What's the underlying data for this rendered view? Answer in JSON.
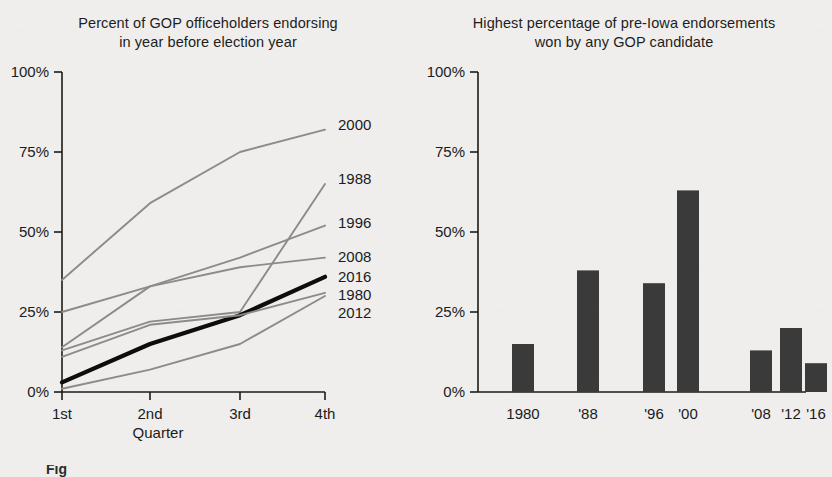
{
  "figure": {
    "caption_fragment": "Fig"
  },
  "left_chart": {
    "title_line1": "Percent of GOP officeholders endorsing",
    "title_line2": "in year before election year",
    "xlabel": "Quarter",
    "ylabel": "",
    "ytick_labels": [
      "0%",
      "25%",
      "50%",
      "75%",
      "100%"
    ],
    "xtick_labels": [
      "1st",
      "2nd",
      "3rd",
      "4th"
    ],
    "series_labels": [
      "2000",
      "1988",
      "1996",
      "2008",
      "2016",
      "1980",
      "2012"
    ]
  },
  "right_chart": {
    "title_line1": "Highest percentage of pre-Iowa endorsements",
    "title_line2": "won by any GOP candidate",
    "ytick_labels": [
      "0%",
      "25%",
      "50%",
      "75%",
      "100%"
    ],
    "xtick_labels": [
      "1980",
      "'88",
      "'96",
      "'00",
      "'08",
      "'12",
      "'16"
    ]
  },
  "colors": {
    "background": "#efeeec",
    "axis": "#1b1b1b",
    "line_gray": "#8b8b8b",
    "line_highlight": "#0d0d0d",
    "bar_fill": "#3a3a3a",
    "text": "#1b1b1b"
  },
  "chart_data": [
    {
      "type": "line",
      "title": "Percent of GOP officeholders endorsing in year before election year",
      "xlabel": "Quarter",
      "ylabel": "Percent of GOP officeholders endorsing",
      "x": [
        "1st",
        "2nd",
        "3rd",
        "4th"
      ],
      "ylim": [
        0,
        100
      ],
      "xlim_categories": 4,
      "grid": false,
      "legend": "right-of-plot end-labels",
      "series": [
        {
          "name": "2000",
          "values": [
            35,
            59,
            75,
            82
          ],
          "style": "gray",
          "end_label": "2000"
        },
        {
          "name": "1988",
          "values": [
            13,
            22,
            25,
            65
          ],
          "style": "gray",
          "end_label": "1988"
        },
        {
          "name": "1996",
          "values": [
            14,
            33,
            42,
            52
          ],
          "style": "gray",
          "end_label": "1996"
        },
        {
          "name": "2008",
          "values": [
            25,
            33,
            39,
            42
          ],
          "style": "gray",
          "end_label": "2008"
        },
        {
          "name": "2016",
          "values": [
            3,
            15,
            24,
            36
          ],
          "style": "highlight",
          "end_label": "2016"
        },
        {
          "name": "1980",
          "values": [
            11,
            21,
            24,
            31
          ],
          "style": "gray",
          "end_label": "1980"
        },
        {
          "name": "2012",
          "values": [
            1,
            7,
            15,
            30
          ],
          "style": "gray",
          "end_label": "2012"
        }
      ]
    },
    {
      "type": "bar",
      "title": "Highest percentage of pre-Iowa endorsements won by any GOP candidate",
      "xlabel": "",
      "ylabel": "",
      "categories": [
        "1980",
        "'88",
        "'96",
        "'00",
        "'08",
        "'12",
        "'16"
      ],
      "values": [
        15,
        38,
        34,
        63,
        13,
        20,
        9
      ],
      "ylim": [
        0,
        100
      ],
      "grid": false,
      "legend": "none"
    }
  ]
}
